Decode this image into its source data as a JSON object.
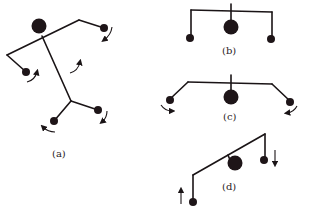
{
  "figure": {
    "panels": [
      {
        "id": "a",
        "label": "(a)",
        "description": "mobile with rotating arms, all balls rotating"
      },
      {
        "id": "b",
        "label": "(b)",
        "description": "symmetric mobile at rest, horizontal bar"
      },
      {
        "id": "c",
        "label": "(c)",
        "description": "mobile with bent arms, outer balls rotating"
      },
      {
        "id": "d",
        "label": "(d)",
        "description": "tilted mobile, outer balls moving vertically in opposite directions"
      }
    ],
    "colors": {
      "ink": "#1a1416",
      "background": "#ffffff"
    }
  }
}
